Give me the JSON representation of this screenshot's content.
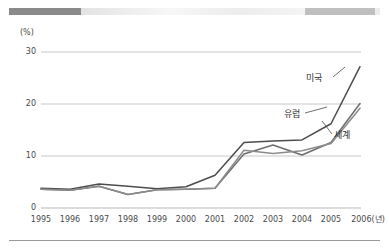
{
  "topbar": {
    "segments": [
      {
        "name": "dark-segment",
        "color": "#8a8a8a"
      },
      {
        "name": "light-segment",
        "color": "#efefef"
      },
      {
        "name": "mid-segment",
        "color": "#bfbfbf"
      },
      {
        "name": "tail-segment",
        "color": "#ececec"
      }
    ]
  },
  "axis": {
    "unit_label": "(%)",
    "y_ticks": [
      "30",
      "20",
      "10",
      "0"
    ],
    "x_ticks": [
      "1995",
      "1996",
      "1997",
      "1998",
      "1999",
      "2000",
      "2001",
      "2002",
      "2003",
      "2004",
      "2005",
      "2006(년)"
    ]
  },
  "labels": {
    "usa": "미국",
    "europe": "유럽",
    "world": "세계"
  },
  "chart_data": {
    "type": "line",
    "title": "",
    "xlabel": "2006(년)",
    "ylabel": "(%)",
    "ylim": [
      0,
      30
    ],
    "yticks": [
      0,
      10,
      20,
      30
    ],
    "grid": true,
    "legend_position": "inline-right",
    "categories": [
      "1995",
      "1996",
      "1997",
      "1998",
      "1999",
      "2000",
      "2001",
      "2002",
      "2003",
      "2004",
      "2005",
      "2006"
    ],
    "series": [
      {
        "name": "미국",
        "color": "#4d4d4d",
        "values": [
          3.8,
          3.6,
          4.6,
          4.2,
          3.7,
          4.1,
          6.3,
          12.6,
          12.9,
          13.1,
          16.2,
          27.2
        ]
      },
      {
        "name": "유럽",
        "color": "#6e6e6e",
        "values": [
          3.6,
          3.4,
          4.2,
          2.6,
          3.5,
          3.6,
          3.8,
          10.4,
          12.1,
          10.2,
          12.6,
          20.1
        ]
      },
      {
        "name": "세계",
        "color": "#8c8c8c",
        "values": [
          3.6,
          3.4,
          4.2,
          2.6,
          3.5,
          3.6,
          3.8,
          11.1,
          10.5,
          11.0,
          12.4,
          19.2
        ]
      }
    ]
  }
}
